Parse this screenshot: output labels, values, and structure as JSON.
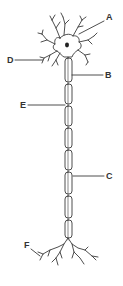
{
  "diagram": {
    "type": "neuron",
    "stroke_color": "#3a3a3a",
    "background": "#ffffff",
    "labels": [
      {
        "id": "A",
        "text": "A",
        "x": 106,
        "y": 17
      },
      {
        "id": "B",
        "text": "B",
        "x": 105,
        "y": 71
      },
      {
        "id": "C",
        "text": "C",
        "x": 106,
        "y": 172
      },
      {
        "id": "D",
        "text": "D",
        "x": 7,
        "y": 56
      },
      {
        "id": "E",
        "text": "E",
        "x": 20,
        "y": 101
      },
      {
        "id": "F",
        "text": "F",
        "x": 24,
        "y": 245
      }
    ],
    "myelin_segments": [
      {
        "y": 58,
        "h": 24
      },
      {
        "y": 84,
        "h": 20
      },
      {
        "y": 106,
        "h": 20
      },
      {
        "y": 128,
        "h": 20
      },
      {
        "y": 150,
        "h": 20
      },
      {
        "y": 172,
        "h": 22
      },
      {
        "y": 196,
        "h": 22
      },
      {
        "y": 220,
        "h": 18
      }
    ]
  }
}
